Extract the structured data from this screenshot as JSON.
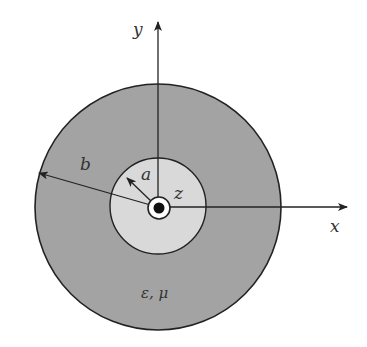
{
  "diagram": {
    "labels": {
      "y_axis": "y",
      "x_axis": "x",
      "outer_radius": "b",
      "inner_radius": "a",
      "z_axis": "z",
      "material": "ε, μ"
    },
    "colors": {
      "background": "#ffffff",
      "dielectric_fill": "#a3a3a3",
      "inner_region_fill": "#d9d9d9",
      "stroke": "#222222",
      "label": "#333333"
    },
    "geometry": {
      "center": [
        158,
        207
      ],
      "outer_radius_px": 123,
      "inner_region_radius_px": 48,
      "conductor_outline_radius_px": 11,
      "conductor_core_radius_px": 5
    }
  }
}
